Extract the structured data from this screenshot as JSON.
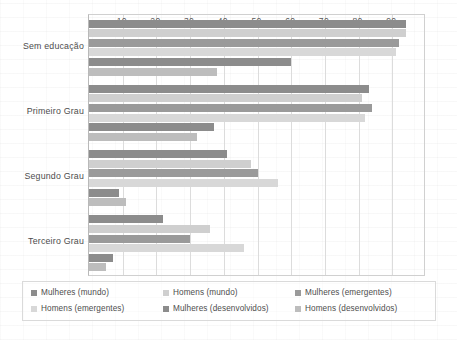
{
  "chart_data": {
    "type": "bar",
    "orientation": "horizontal",
    "title": "",
    "xlabel": "",
    "ylabel": "",
    "xlim": [
      0,
      100
    ],
    "ylim": null,
    "grid": true,
    "legend_position": "bottom",
    "categories": [
      "Sem educação",
      "Primeiro Grau",
      "Segundo Grau",
      "Terceiro Grau"
    ],
    "xticks": [
      10,
      20,
      30,
      40,
      50,
      60,
      70,
      80,
      90
    ],
    "series": [
      {
        "name": "Mulheres (mundo)",
        "color": "#8c8c8c",
        "values": [
          94,
          83,
          41,
          22
        ]
      },
      {
        "name": "Homens (mundo)",
        "color": "#cfcfcf",
        "values": [
          94,
          81,
          48,
          36
        ]
      },
      {
        "name": "Mulheres (emergentes)",
        "color": "#9a9a9a",
        "values": [
          92,
          84,
          50,
          30
        ]
      },
      {
        "name": "Homens (emergentes)",
        "color": "#d8d8d8",
        "values": [
          91,
          82,
          56,
          46
        ]
      },
      {
        "name": "Mulheres (desenvolvidos)",
        "color": "#8c8c8c",
        "values": [
          60,
          37,
          9,
          7
        ]
      },
      {
        "name": "Homens (desenvolvidos)",
        "color": "#bdbdbd",
        "values": [
          38,
          32,
          11,
          5
        ]
      }
    ]
  },
  "legend": {
    "items": [
      {
        "label": "Mulheres (mundo)",
        "swatch": "#8c8c8c"
      },
      {
        "label": "Homens (mundo)",
        "swatch": "#cfcfcf"
      },
      {
        "label": "Mulheres (emergentes)",
        "swatch": "#9a9a9a"
      },
      {
        "label": "Homens (emergentes)",
        "swatch": "#d8d8d8"
      },
      {
        "label": "Mulheres (desenvolvidos)",
        "swatch": "#8c8c8c"
      },
      {
        "label": "Homens (desenvolvidos)",
        "swatch": "#bdbdbd"
      }
    ]
  }
}
